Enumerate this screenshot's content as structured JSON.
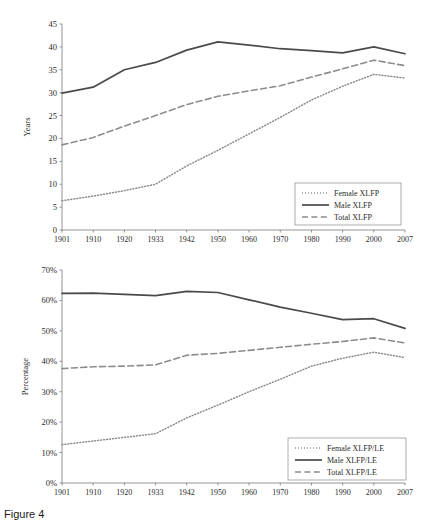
{
  "figure": {
    "caption": "Figure 4"
  },
  "chart_data": [
    {
      "id": "top",
      "type": "line",
      "title": "",
      "xlabel": "",
      "ylabel": "Years",
      "categories": [
        "1901",
        "1910",
        "1920",
        "1933",
        "1942",
        "1950",
        "1960",
        "1970",
        "1980",
        "1990",
        "2000",
        "2007"
      ],
      "ylim": [
        0,
        45
      ],
      "ytick_step": 5,
      "yticks": [
        "0",
        "5",
        "10",
        "15",
        "20",
        "25",
        "30",
        "35",
        "40",
        "45"
      ],
      "grid": false,
      "legend_position": "bottom-right",
      "series": [
        {
          "name": "Female XLFP",
          "style": "dotted",
          "color": "#8c8c8c",
          "values": [
            6.4,
            7.4,
            8.6,
            10.0,
            14.0,
            17.4,
            21.0,
            24.6,
            28.4,
            31.4,
            34.0,
            33.2
          ]
        },
        {
          "name": "Male XLFP",
          "style": "solid",
          "color": "#4a4a4a",
          "values": [
            29.9,
            31.2,
            35.0,
            36.6,
            39.3,
            41.1,
            40.4,
            39.6,
            39.2,
            38.7,
            40.0,
            38.5
          ]
        },
        {
          "name": "Total XLFP",
          "style": "dashed",
          "color": "#8c8c8c",
          "values": [
            18.6,
            20.2,
            22.7,
            25.0,
            27.4,
            29.2,
            30.4,
            31.5,
            33.4,
            35.2,
            37.1,
            35.9
          ]
        }
      ]
    },
    {
      "id": "bottom",
      "type": "line",
      "title": "",
      "xlabel": "",
      "ylabel": "Percentage",
      "categories": [
        "1901",
        "1910",
        "1920",
        "1933",
        "1942",
        "1950",
        "1960",
        "1970",
        "1980",
        "1990",
        "2000",
        "2007"
      ],
      "ylim": [
        0,
        70
      ],
      "ytick_step": 10,
      "yticks": [
        "0%",
        "10%",
        "20%",
        "30%",
        "40%",
        "50%",
        "60%",
        "70%"
      ],
      "grid": false,
      "legend_position": "bottom-right",
      "series": [
        {
          "name": "Female XLFP/LE",
          "style": "dotted",
          "color": "#8c8c8c",
          "values": [
            12.6,
            13.8,
            15.0,
            16.2,
            21.4,
            25.6,
            30.0,
            34.1,
            38.4,
            41.0,
            43.0,
            41.2
          ]
        },
        {
          "name": "Male XLFP/LE",
          "style": "solid",
          "color": "#4a4a4a",
          "values": [
            62.3,
            62.4,
            62.0,
            61.6,
            63.0,
            62.6,
            60.2,
            57.8,
            55.8,
            53.7,
            54.0,
            50.8
          ]
        },
        {
          "name": "Total XLFP/LE",
          "style": "dashed",
          "color": "#8c8c8c",
          "values": [
            37.6,
            38.2,
            38.4,
            38.8,
            42.0,
            42.6,
            43.6,
            44.6,
            45.6,
            46.5,
            47.7,
            46.0
          ]
        }
      ]
    }
  ]
}
